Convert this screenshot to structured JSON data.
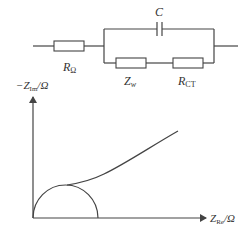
{
  "diagram": {
    "title": "",
    "circuit": {
      "components": [
        {
          "id": "r-ohm",
          "type": "resistor",
          "label_main": "R",
          "label_sub": "Ω"
        },
        {
          "id": "c",
          "type": "capacitor",
          "label_main": "C",
          "label_sub": ""
        },
        {
          "id": "z-w",
          "type": "resistor",
          "label_main": "Z",
          "label_sub": "w"
        },
        {
          "id": "r-ct",
          "type": "resistor",
          "label_main": "R",
          "label_sub": "CT"
        }
      ],
      "topology": "R_Ω in series with (C parallel to (Z_w series R_CT))"
    },
    "plot": {
      "y_axis_label": {
        "prefix": "−Z",
        "sub": "Im",
        "suffix": "/Ω"
      },
      "x_axis_label": {
        "prefix": "Z",
        "sub": "Re",
        "suffix": "/Ω"
      },
      "curves": [
        "semicircle",
        "diffusion-line"
      ]
    },
    "colors": {
      "stroke": "#444444",
      "text": "#333333",
      "background": "#ffffff"
    }
  }
}
